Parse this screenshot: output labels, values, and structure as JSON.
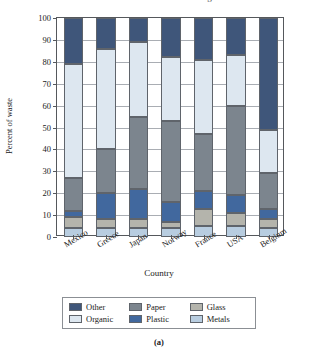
{
  "figure": {
    "title": "Percent of waste in different categories",
    "caption": "(a)"
  },
  "chart_data": {
    "type": "bar",
    "stacked": true,
    "title": "Percent of waste in different categories",
    "xlabel": "Country",
    "ylabel": "Percent of waste",
    "ylim": [
      0,
      100
    ],
    "yticks": [
      0,
      10,
      20,
      30,
      40,
      50,
      60,
      70,
      80,
      90,
      100
    ],
    "ytick_labels": [
      "0",
      "10",
      "20",
      "30",
      "40",
      "50",
      "60",
      "70",
      "80",
      "90",
      "100"
    ],
    "grid": true,
    "legend_position": "below-axes",
    "categories": [
      "Mexico",
      "Greece",
      "Japan",
      "Norway",
      "France",
      "USA",
      "Belgium"
    ],
    "series": [
      {
        "name": "Metals",
        "color": "#b8cde0",
        "values": [
          4,
          4,
          4,
          4,
          5,
          5,
          4
        ]
      },
      {
        "name": "Glass",
        "color": "#b4b4ac",
        "values": [
          5,
          4,
          4,
          3,
          8,
          6,
          4
        ]
      },
      {
        "name": "Plastic",
        "color": "#41689e",
        "values": [
          3,
          12,
          14,
          9,
          8,
          8,
          5
        ]
      },
      {
        "name": "Paper",
        "color": "#7c858e",
        "values": [
          15,
          20,
          33,
          37,
          26,
          41,
          16
        ]
      },
      {
        "name": "Organic",
        "color": "#dde7f0",
        "values": [
          52,
          46,
          34,
          29,
          34,
          23,
          20
        ]
      },
      {
        "name": "Other",
        "color": "#3f567a",
        "values": [
          21,
          14,
          11,
          18,
          19,
          17,
          51
        ]
      }
    ]
  },
  "legend": {
    "entries": [
      {
        "label": "Other",
        "color": "#3f567a"
      },
      {
        "label": "Paper",
        "color": "#7c858e"
      },
      {
        "label": "Glass",
        "color": "#b4b4ac"
      },
      {
        "label": "Organic",
        "color": "#dde7f0"
      },
      {
        "label": "Plastic",
        "color": "#41689e"
      },
      {
        "label": "Metals",
        "color": "#b8cde0"
      }
    ]
  }
}
